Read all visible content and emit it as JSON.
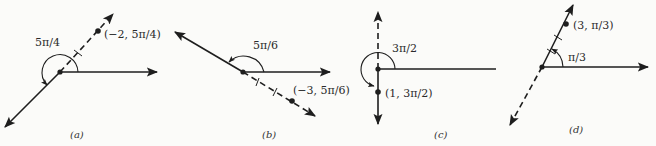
{
  "figure": {
    "panels": [
      {
        "id": "a",
        "caption": "(a)",
        "angle_label": "5π/4",
        "point_label": "(−2, 5π/4)",
        "r": -2,
        "theta": "5π/4"
      },
      {
        "id": "b",
        "caption": "(b)",
        "angle_label": "5π/6",
        "point_label": "(−3, 5π/6)",
        "r": -3,
        "theta": "5π/6"
      },
      {
        "id": "c",
        "caption": "(c)",
        "angle_label": "3π/2",
        "point_label": "(1, 3π/2)",
        "r": 1,
        "theta": "3π/2"
      },
      {
        "id": "d",
        "caption": "(d)",
        "angle_label": "π/3",
        "point_label": "(3, π/3)",
        "r": 3,
        "theta": "π/3"
      }
    ],
    "colors": {
      "ink": "#1e1e1e",
      "background": "#fbfbf9"
    }
  }
}
